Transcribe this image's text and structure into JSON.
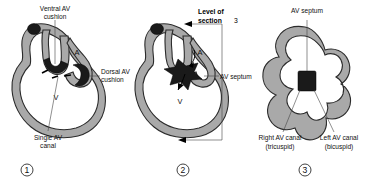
{
  "figure": {
    "background_color": "#ffffff",
    "wall_color": "#a9a9a9",
    "wall_outline_color": "#2b2b2b",
    "cushion_color": "#1a1a1a",
    "label_color": "#111111"
  },
  "panels": [
    {
      "number": "①",
      "id": "panel-1",
      "stage_name": "Single AV canal stage",
      "labels": {
        "top": "Ventral AV\ncushion",
        "top_line1": "Ventral AV",
        "top_line2": "cushion",
        "right_line1": "Dorsal AV",
        "right_line2": "cushion",
        "bottom_line1": "Single AV",
        "bottom_line2": "canal",
        "chamber_atrium": "A",
        "chamber_ventricle": "V"
      }
    },
    {
      "number": "②",
      "id": "panel-2",
      "stage_name": "Fused AV cushions forming AV septum",
      "labels": {
        "level_line1": "Level of",
        "level_line2": "section",
        "level_section_number": "3",
        "right": "AV septum",
        "chamber_atrium": "A",
        "chamber_ventricle": "V"
      }
    },
    {
      "number": "③",
      "id": "panel-3",
      "stage_name": "Cross section through AV canals",
      "labels": {
        "top": "AV septum",
        "bottom_left_line1": "Right AV canal",
        "bottom_left_line2": "(tricuspid)",
        "bottom_right_line1": "Left AV canal",
        "bottom_right_line2": "(bicuspid)"
      }
    }
  ]
}
